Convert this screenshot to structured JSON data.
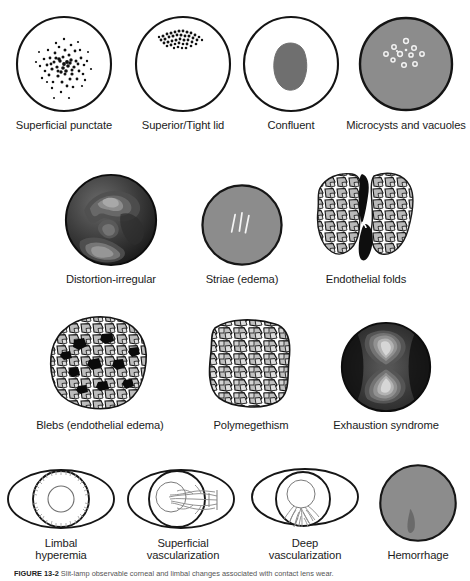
{
  "figure": {
    "caption_label": "FIGURE 13-2",
    "caption_text": "Slit-lamp observable corneal and limbal changes associated with contact lens wear.",
    "colors": {
      "outline": "#1a1a1a",
      "gray_fill": "#8c8c8c",
      "dark_fill": "#6b6b6b",
      "cell_fill": "#b5b5b5",
      "text": "#1b1b1b"
    }
  },
  "rows": [
    {
      "id": "row-epithelial-staining",
      "panels": [
        {
          "id": "superficial-punctate",
          "label": "Superficial punctate",
          "art": "circle-stipple-central"
        },
        {
          "id": "superior-tight-lid",
          "label": "Superior/Tight lid",
          "art": "circle-stipple-superior"
        },
        {
          "id": "confluent",
          "label": "Confluent",
          "art": "circle-blob"
        },
        {
          "id": "microcysts-and-vacuoles",
          "label": "Microcysts and vacuoles",
          "art": "circle-gray-microcysts"
        }
      ]
    },
    {
      "id": "row-corneal-distortion",
      "panels": [
        {
          "id": "distortion-irregular",
          "label": "Distortion-irregular",
          "art": "sphere-dark-contours"
        },
        {
          "id": "striae-edema",
          "label": "Striae (edema)",
          "art": "circle-gray-striae"
        },
        {
          "id": "endothelial-folds",
          "label": "Endothelial folds",
          "art": "mosaic-with-folds"
        }
      ]
    },
    {
      "id": "row-endothelial-changes",
      "panels": [
        {
          "id": "blebs-endothelial-edema",
          "label": "Blebs (endothelial edema)",
          "art": "mosaic-with-blebs"
        },
        {
          "id": "polymegethism",
          "label": "Polymegethism",
          "art": "mosaic-irregular"
        },
        {
          "id": "exhaustion-syndrome",
          "label": "Exhaustion syndrome",
          "art": "sphere-hourglass"
        }
      ]
    },
    {
      "id": "row-limbal-vascular",
      "panels": [
        {
          "id": "limbal-hyperemia",
          "label": "Limbal\nhyperemia",
          "art": "eye-limbal-hyperemia"
        },
        {
          "id": "superficial-vascularization",
          "label": "Superficial\nvascularization",
          "art": "eye-superficial-vessels"
        },
        {
          "id": "deep-vascularization",
          "label": "Deep\nvascularization",
          "art": "eye-deep-vessels"
        },
        {
          "id": "hemorrhage",
          "label": "Hemorrhage",
          "art": "circle-gray-hemorrhage"
        }
      ]
    }
  ]
}
